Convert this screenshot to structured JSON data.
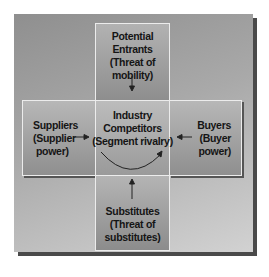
{
  "diagram": {
    "type": "five-forces",
    "top": {
      "lines": [
        "Potential Entrants",
        "(Threat of",
        "mobility)"
      ]
    },
    "left": {
      "lines": [
        "Suppliers",
        "(Supplier",
        "power)"
      ]
    },
    "center": {
      "lines": [
        "Industry",
        "Competitors",
        "(Segment rivalry)"
      ]
    },
    "right": {
      "lines": [
        "Buyers",
        "(Buyer",
        "power)"
      ]
    },
    "bottom": {
      "lines": [
        "Substitutes",
        "(Threat of",
        "substitutes)"
      ]
    },
    "arrows": [
      {
        "from": "top",
        "to": "center",
        "icon": "arrow-down-icon"
      },
      {
        "from": "left",
        "to": "center",
        "icon": "arrow-right-icon"
      },
      {
        "from": "right",
        "to": "center",
        "icon": "arrow-left-icon"
      },
      {
        "from": "bottom",
        "to": "center",
        "icon": "arrow-up-icon"
      },
      {
        "from": "center",
        "to": "center",
        "icon": "circular-arrow-icon"
      }
    ],
    "colors": {
      "panel": "#a8a8a8",
      "box_border": "#ececec",
      "shadow": "#4a4a4a",
      "text": "#151515"
    }
  }
}
